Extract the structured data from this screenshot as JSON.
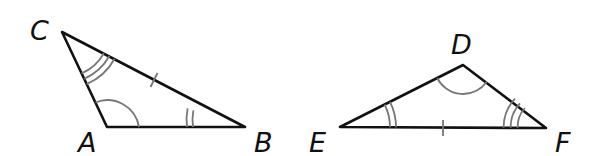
{
  "figure": {
    "triangles": [
      {
        "name": "ABC",
        "vertices": [
          {
            "label": "C",
            "angle_marks": 3
          },
          {
            "label": "A",
            "angle_marks": 1
          },
          {
            "label": "B",
            "angle_marks": 2
          }
        ],
        "tick_marked_side": "CB"
      },
      {
        "name": "DEF",
        "vertices": [
          {
            "label": "D",
            "angle_marks": 1
          },
          {
            "label": "E",
            "angle_marks": 2
          },
          {
            "label": "F",
            "angle_marks": 3
          }
        ],
        "tick_marked_side": "EF"
      }
    ]
  },
  "labels": {
    "A": "A",
    "B": "B",
    "C": "C",
    "D": "D",
    "E": "E",
    "F": "F"
  },
  "colors": {
    "sides": "#111111",
    "marks": "#777777",
    "background": "#ffffff"
  }
}
